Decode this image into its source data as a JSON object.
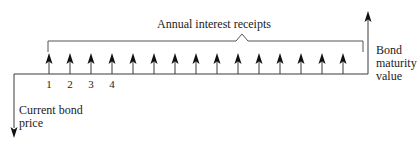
{
  "diagram": {
    "type": "cash-flow timeline",
    "bracket_label": "Annual interest receipts",
    "outflow_label_line1": "Current bond",
    "outflow_label_line2": "price",
    "maturity_label_line1": "Bond",
    "maturity_label_line2": "maturity",
    "maturity_label_line3": "value",
    "period_labels": [
      "1",
      "2",
      "3",
      "4"
    ],
    "interest_arrow_count": 15,
    "colors": {
      "line": "#3a3a3a",
      "arrowhead": "#111111",
      "text": "#222222"
    }
  }
}
